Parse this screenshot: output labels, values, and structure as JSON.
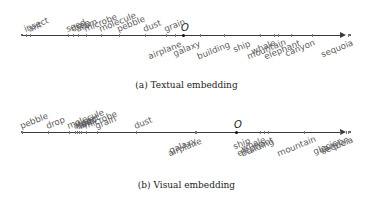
{
  "panels": [
    {
      "id": "a",
      "caption": "(a) Textual embedding",
      "origin_label": "O",
      "above": [
        {
          "word": "insect",
          "x": 26
        },
        {
          "word": "ant",
          "x": 30
        },
        {
          "word": "seed",
          "x": 68
        },
        {
          "word": "drop",
          "x": 73
        },
        {
          "word": "atom",
          "x": 78
        },
        {
          "word": "microbe",
          "x": 86
        },
        {
          "word": "molecule",
          "x": 101
        },
        {
          "word": "pebble",
          "x": 119
        },
        {
          "word": "dust",
          "x": 145
        },
        {
          "word": "grain",
          "x": 166
        }
      ],
      "below": [
        {
          "word": "airplane",
          "x": 147
        },
        {
          "word": "galaxy",
          "x": 172
        },
        {
          "word": "building",
          "x": 196
        },
        {
          "word": "ship",
          "x": 232
        },
        {
          "word": "whale",
          "x": 250
        },
        {
          "word": "mountain",
          "x": 246
        },
        {
          "word": "elephant",
          "x": 263
        },
        {
          "word": "canyon",
          "x": 284
        },
        {
          "word": "sequoia",
          "x": 320
        }
      ]
    },
    {
      "id": "b",
      "caption": "(b) Visual embedding",
      "origin_label": "O",
      "above": [
        {
          "word": "pebble",
          "x": 22
        },
        {
          "word": "drop",
          "x": 48
        },
        {
          "word": "molecule",
          "x": 69
        },
        {
          "word": "seed",
          "x": 79
        },
        {
          "word": "insect",
          "x": 77
        },
        {
          "word": "atom",
          "x": 75
        },
        {
          "word": "ant",
          "x": 81
        },
        {
          "word": "microbe",
          "x": 86
        },
        {
          "word": "grain",
          "x": 97
        },
        {
          "word": "dust",
          "x": 136
        }
      ],
      "below": [
        {
          "word": "galaxy",
          "x": 168
        },
        {
          "word": "airplane",
          "x": 167
        },
        {
          "word": "ship",
          "x": 232
        },
        {
          "word": "whale",
          "x": 240
        },
        {
          "word": "building",
          "x": 240
        },
        {
          "word": "elephant",
          "x": 236
        },
        {
          "word": "mountain",
          "x": 276
        },
        {
          "word": "glacier",
          "x": 312
        },
        {
          "word": "canyon",
          "x": 318
        },
        {
          "word": "sequoia",
          "x": 320
        }
      ]
    }
  ]
}
